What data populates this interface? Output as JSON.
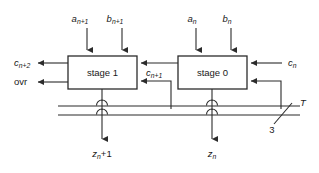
{
  "diagram": {
    "blocks": [
      {
        "id": "stage1",
        "label": "stage 1"
      },
      {
        "id": "stage0",
        "label": "stage 0"
      }
    ],
    "inputs_top": [
      {
        "id": "a_np1",
        "base": "a",
        "sub": "n+1"
      },
      {
        "id": "b_np1",
        "base": "b",
        "sub": "n+1"
      },
      {
        "id": "a_n",
        "base": "a",
        "sub": "n"
      },
      {
        "id": "b_n",
        "base": "b",
        "sub": "n"
      }
    ],
    "outputs_left": [
      {
        "id": "c_np2",
        "base": "c",
        "sub": "n+2"
      },
      {
        "id": "ovr",
        "base": "ovr",
        "sub": ""
      }
    ],
    "carry_internal": {
      "id": "c_np1",
      "base": "c",
      "sub": "n+1"
    },
    "input_right": {
      "id": "c_n",
      "base": "c",
      "sub": "n"
    },
    "outputs_bottom": [
      {
        "id": "z_np1",
        "base": "z",
        "sub": "n",
        "suffix": "+1"
      },
      {
        "id": "z_n",
        "base": "z",
        "sub": "n",
        "suffix": ""
      }
    ],
    "bus": {
      "label": "T",
      "width_label": "3"
    },
    "colors": {
      "line": "#2b2b2b",
      "text": "#1a1a1a",
      "background": "#ffffff"
    }
  }
}
